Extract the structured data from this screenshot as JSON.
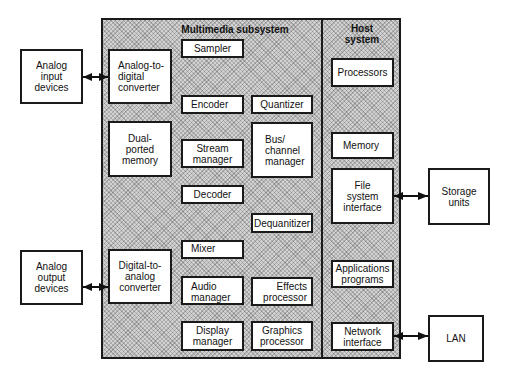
{
  "diagram": {
    "multimedia_subsystem": {
      "title": "Multimedia subsystem",
      "components": {
        "sampler": "Sampler",
        "adc": "Analog-to-\ndigital\nconverter",
        "encoder": "Encoder",
        "quantizer": "Quantizer",
        "dual_ported_memory": "Dual-\nported\nmemory",
        "stream_manager": "Stream\nmanager",
        "bus_channel_manager": "Bus/\nchannel\nmanager",
        "decoder": "Decoder",
        "dequantizer": "Dequanitizer",
        "mixer": "Mixer",
        "dac": "Digital-to-\nanalog\nconverter",
        "audio_manager": "Audio\nmanager",
        "effects_processor": "Effects\nprocessor",
        "display_manager": "Display\nmanager",
        "graphics_processor": "Graphics\nprocessor"
      }
    },
    "host_system": {
      "title": "Host\nsystem",
      "components": {
        "processors": "Processors",
        "memory": "Memory",
        "file_system_interface": "File\nsystem\ninterface",
        "applications_programs": "Applications\nprograms",
        "network_interface": "Network\ninterface"
      }
    },
    "external": {
      "analog_input_devices": "Analog\ninput\ndevices",
      "analog_output_devices": "Analog\noutput\ndevices",
      "storage_units": "Storage\nunits",
      "lan": "LAN"
    },
    "connections": [
      {
        "from": "Analog input devices",
        "to": "Analog-to-digital converter",
        "type": "bidirectional"
      },
      {
        "from": "Analog output devices",
        "to": "Digital-to-analog converter",
        "type": "bidirectional"
      },
      {
        "from": "File system interface",
        "to": "Storage units",
        "type": "bidirectional"
      },
      {
        "from": "Network interface",
        "to": "LAN",
        "type": "bidirectional"
      }
    ]
  }
}
